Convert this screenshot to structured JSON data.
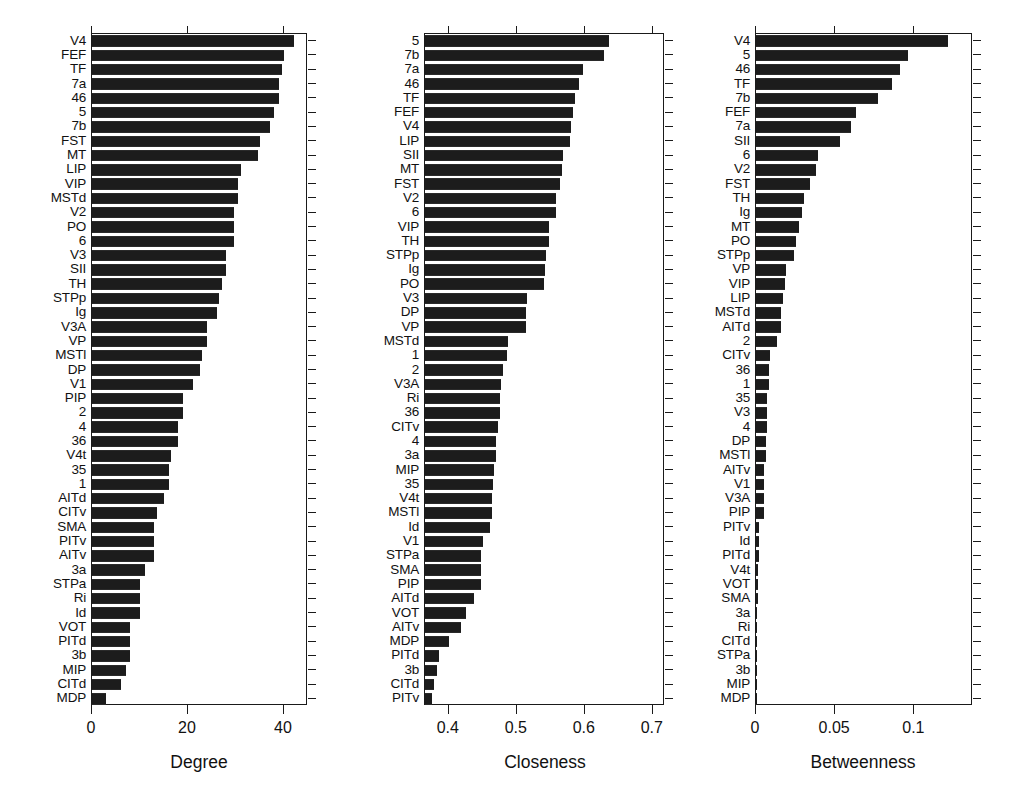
{
  "figure": {
    "background": "#ffffff",
    "bar_color": "#1c1c1c",
    "axis_color": "#1a1a1a",
    "panel_count": 3
  },
  "chart_data": [
    {
      "type": "bar",
      "orientation": "horizontal",
      "title": "",
      "xlabel": "Degree",
      "ylabel": "",
      "xlim": [
        0,
        45
      ],
      "xticks": [
        0,
        20,
        40
      ],
      "xticklabels": [
        "0",
        "20",
        "40"
      ],
      "grid": false,
      "legend": "none",
      "categories": [
        "V4",
        "FEF",
        "TF",
        "7a",
        "46",
        "5",
        "7b",
        "FST",
        "MT",
        "LIP",
        "VIP",
        "MSTd",
        "V2",
        "PO",
        "6",
        "V3",
        "SII",
        "TH",
        "STPp",
        "Ig",
        "V3A",
        "VP",
        "MSTl",
        "DP",
        "V1",
        "PIP",
        "2",
        "4",
        "36",
        "V4t",
        "35",
        "1",
        "AITd",
        "CITv",
        "SMA",
        "PITv",
        "AITv",
        "3a",
        "STPa",
        "Ri",
        "Id",
        "VOT",
        "PITd",
        "3b",
        "MIP",
        "CITd",
        "MDP"
      ],
      "values": [
        42,
        40,
        39.5,
        39,
        39,
        38,
        37,
        35,
        34.5,
        31,
        30.5,
        30.5,
        29.5,
        29.5,
        29.5,
        28,
        28,
        27,
        26.5,
        26,
        24,
        24,
        23,
        22.5,
        21,
        19,
        19,
        18,
        18,
        16.5,
        16,
        16,
        15,
        13.5,
        13,
        13,
        13,
        11,
        10,
        10,
        10,
        8,
        8,
        8,
        7,
        6,
        3
      ]
    },
    {
      "type": "bar",
      "orientation": "horizontal",
      "title": "",
      "xlabel": "Closeness",
      "ylabel": "",
      "xlim": [
        0.365,
        0.718
      ],
      "xticks": [
        0.4,
        0.5,
        0.6,
        0.7
      ],
      "xticklabels": [
        "0.4",
        "0.5",
        "0.6",
        "0.7"
      ],
      "grid": false,
      "legend": "none",
      "categories": [
        "5",
        "7b",
        "7a",
        "46",
        "TF",
        "FEF",
        "V4",
        "LIP",
        "SII",
        "MT",
        "FST",
        "V2",
        "6",
        "VIP",
        "TH",
        "STPp",
        "Ig",
        "PO",
        "V3",
        "DP",
        "VP",
        "MSTd",
        "1",
        "2",
        "V3A",
        "Ri",
        "36",
        "CITv",
        "4",
        "3a",
        "MIP",
        "35",
        "V4t",
        "MSTl",
        "Id",
        "V1",
        "STPa",
        "SMA",
        "PIP",
        "AITd",
        "VOT",
        "AITv",
        "MDP",
        "PITd",
        "3b",
        "CITd",
        "PITv"
      ],
      "values": [
        0.635,
        0.628,
        0.598,
        0.592,
        0.585,
        0.583,
        0.58,
        0.578,
        0.568,
        0.567,
        0.563,
        0.558,
        0.557,
        0.548,
        0.547,
        0.543,
        0.542,
        0.54,
        0.515,
        0.514,
        0.513,
        0.487,
        0.485,
        0.48,
        0.477,
        0.476,
        0.476,
        0.472,
        0.47,
        0.47,
        0.466,
        0.465,
        0.464,
        0.463,
        0.46,
        0.45,
        0.448,
        0.448,
        0.447,
        0.437,
        0.425,
        0.418,
        0.4,
        0.385,
        0.382,
        0.378,
        0.376
      ]
    },
    {
      "type": "bar",
      "orientation": "horizontal",
      "title": "",
      "xlabel": "Betweenness",
      "ylabel": "",
      "xlim": [
        0,
        0.137
      ],
      "xticks": [
        0,
        0.05,
        0.1
      ],
      "xticklabels": [
        "0",
        "0.05",
        "0.1"
      ],
      "grid": false,
      "legend": "none",
      "categories": [
        "V4",
        "5",
        "46",
        "TF",
        "7b",
        "FEF",
        "7a",
        "SII",
        "6",
        "V2",
        "FST",
        "TH",
        "Ig",
        "MT",
        "PO",
        "STPp",
        "VP",
        "VIP",
        "LIP",
        "MSTd",
        "AITd",
        "2",
        "CITv",
        "36",
        "1",
        "35",
        "V3",
        "4",
        "DP",
        "MSTl",
        "AITv",
        "V1",
        "V3A",
        "PIP",
        "PITv",
        "Id",
        "PITd",
        "V4t",
        "VOT",
        "SMA",
        "3a",
        "Ri",
        "CITd",
        "STPa",
        "3b",
        "MIP",
        "MDP"
      ],
      "values": [
        0.121,
        0.096,
        0.091,
        0.086,
        0.077,
        0.063,
        0.06,
        0.053,
        0.039,
        0.038,
        0.034,
        0.03,
        0.029,
        0.027,
        0.025,
        0.024,
        0.019,
        0.018,
        0.017,
        0.016,
        0.016,
        0.013,
        0.009,
        0.008,
        0.008,
        0.007,
        0.007,
        0.007,
        0.006,
        0.006,
        0.005,
        0.005,
        0.005,
        0.005,
        0.002,
        0.002,
        0.002,
        0.001,
        0.001,
        0.001,
        0.0005,
        0.0003,
        0.0003,
        0.0002,
        0.0001,
        0.0001,
        0.0
      ]
    }
  ]
}
